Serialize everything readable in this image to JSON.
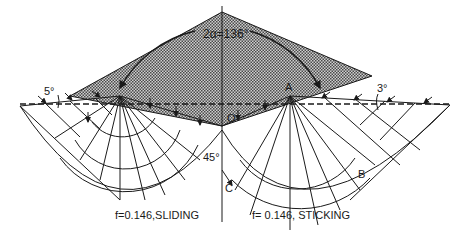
{
  "diagram": {
    "angle_label": "2α=136°",
    "left_angle_label": "5°",
    "right_angle_label": "3°",
    "bottom_angle_label": "45°",
    "point_labels": {
      "origin": "O",
      "A": "A",
      "B": "B",
      "C": "C"
    },
    "captions": {
      "left": "f=0.146,SLIDING",
      "right": "f= 0.146, STICKING"
    },
    "colors": {
      "ink": "#1a1a1a",
      "wedge_fill": "#9a9a9a",
      "background": "#ffffff"
    }
  }
}
